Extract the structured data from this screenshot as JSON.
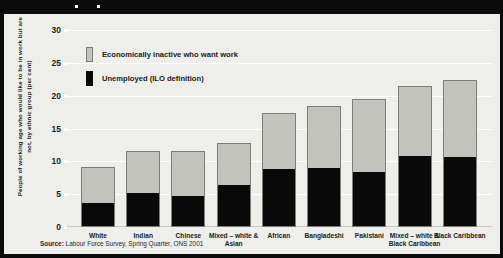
{
  "chart_data": {
    "type": "bar",
    "subtype": "stacked-vertical",
    "title": "",
    "xlabel": "",
    "ylabel": "People of working age who would like to be in work but are not, by ethnic group (per cent)",
    "ylim": [
      0,
      30
    ],
    "yticks": [
      0,
      5,
      10,
      15,
      20,
      25,
      30
    ],
    "grid": true,
    "legend_position": "upper-left-inside",
    "categories": [
      "White",
      "Indian",
      "Chinese",
      "Mixed – white & Asian",
      "African",
      "Bangladeshi",
      "Pakistani",
      "Mixed – white & Black Caribbean",
      "Black Caribbean"
    ],
    "series": [
      {
        "name": "Unemployed (ILO definition)",
        "color": "#090909",
        "values": [
          3.5,
          5.0,
          4.6,
          6.3,
          8.7,
          8.8,
          8.2,
          10.6,
          10.5
        ]
      },
      {
        "name": "Economically inactive who want work",
        "color": "#c3c3bd",
        "values": [
          5.6,
          6.5,
          7.0,
          6.5,
          8.6,
          9.7,
          11.3,
          10.9,
          11.9
        ]
      }
    ],
    "totals": [
      9.1,
      11.5,
      11.6,
      12.8,
      17.3,
      18.5,
      19.5,
      21.5,
      22.4
    ],
    "source": "Source: Labour Force Survey, Spring Quarter, ONS 2001"
  },
  "legend": {
    "items": [
      {
        "label": "Economically inactive who want work",
        "swatch": "grey"
      },
      {
        "label": "Unemployed (ILO definition)",
        "swatch": "black"
      }
    ]
  },
  "source": {
    "prefix": "Source:",
    "text": " Labour Force Survey, Spring Quarter, ONS 2001"
  }
}
